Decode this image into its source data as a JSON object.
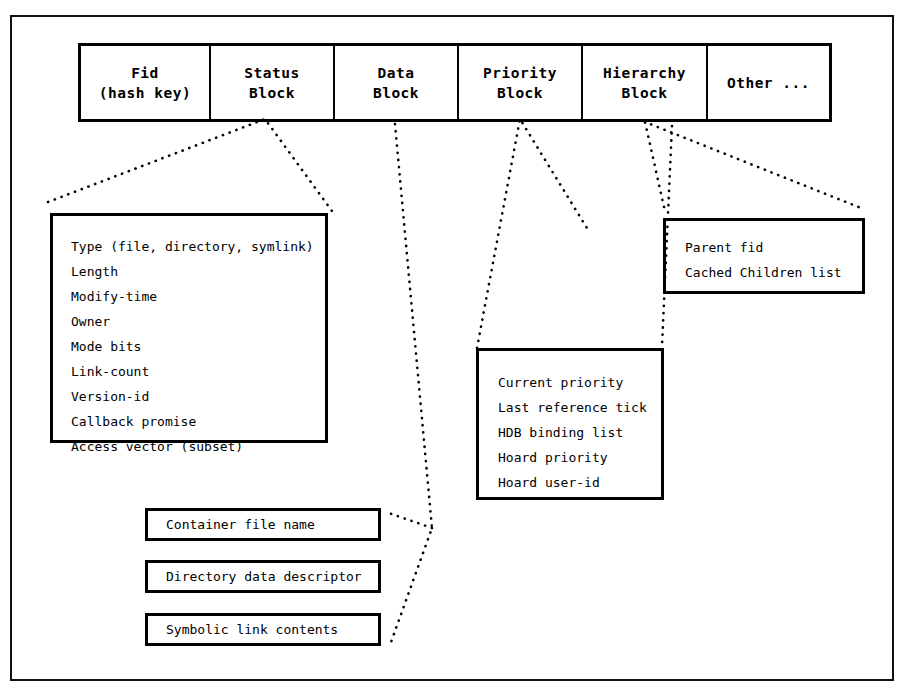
{
  "diagram": {
    "record_table": {
      "cells": [
        {
          "name": "fid",
          "line1": "Fid",
          "line2": "(hash key)"
        },
        {
          "name": "status",
          "line1": "Status",
          "line2": "Block"
        },
        {
          "name": "data",
          "line1": "Data",
          "line2": "Block"
        },
        {
          "name": "priority",
          "line1": "Priority",
          "line2": "Block"
        },
        {
          "name": "hierarchy",
          "line1": "Hierarchy",
          "line2": "Block"
        },
        {
          "name": "other",
          "line1": "Other ...",
          "line2": ""
        }
      ]
    },
    "status_block": {
      "fields": [
        "Type (file, directory, symlink)",
        "Length",
        "Modify-time",
        "Owner",
        "Mode bits",
        "Link-count",
        "Version-id",
        "Callback promise",
        "Access vector (subset)"
      ]
    },
    "priority_block": {
      "fields": [
        "Current priority",
        "Last reference tick",
        "HDB binding list",
        "Hoard priority",
        "Hoard user-id"
      ]
    },
    "hierarchy_block": {
      "fields": [
        "Parent fid",
        "Cached Children list"
      ]
    },
    "data_block": {
      "boxes": [
        "Container file name",
        "Directory data descriptor",
        "Symbolic link contents"
      ]
    },
    "colors": {
      "ink": "#000000",
      "paper": "#ffffff"
    }
  }
}
